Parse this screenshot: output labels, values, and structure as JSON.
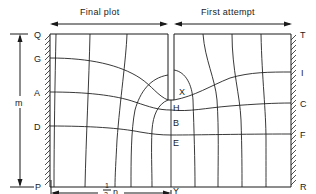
{
  "figure": {
    "type": "flow-net-diagram",
    "headers": {
      "left": "Final plot",
      "right": "First attempt"
    },
    "left_boundary_labels": [
      "Q",
      "G",
      "A",
      "D",
      "P"
    ],
    "right_boundary_labels": [
      "T",
      "I",
      "C",
      "F",
      "R"
    ],
    "center_labels": [
      "X",
      "H",
      "B",
      "E",
      "Y"
    ],
    "dimensions": {
      "height_label": "m",
      "width_label_num": "1",
      "width_label_den": "2",
      "width_label_var": "n"
    },
    "colors": {
      "ink": "#1a1a1a",
      "background": "#ffffff"
    }
  }
}
